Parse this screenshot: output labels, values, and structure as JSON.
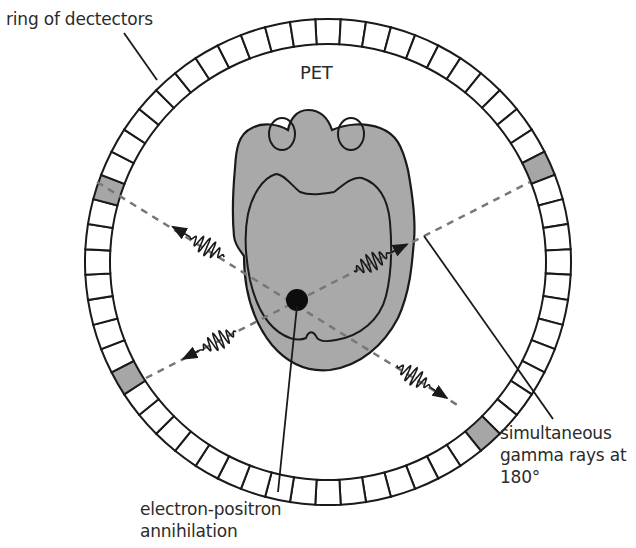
{
  "diagram": {
    "title": "PET",
    "labels": {
      "ring": "ring of dectectors",
      "gamma": [
        "simultaneous",
        "gamma rays at",
        "180°"
      ],
      "annihilation": [
        "electron-positron",
        "annihilation"
      ]
    },
    "ring": {
      "center": [
        328,
        262
      ],
      "outer_radius": 243,
      "inner_radius": 218,
      "detector_count": 60,
      "detector_fill": "#ffffff",
      "active_detector_fill": "#a6a6a6",
      "active_detectors": [
        {
          "name": "left-upper",
          "x": 97,
          "y": 182
        },
        {
          "name": "right-upper",
          "x": 530,
          "y": 182
        },
        {
          "name": "left-lower",
          "x": 146,
          "y": 378
        },
        {
          "name": "right-lower",
          "x": 459,
          "y": 406
        }
      ]
    },
    "annihilation_point": [
      297,
      300
    ],
    "colors": {
      "stroke": "#1a1a1a",
      "head_fill": "#a9a9a9",
      "dashed_line": "#777777",
      "text": "#2b2b2b"
    }
  }
}
